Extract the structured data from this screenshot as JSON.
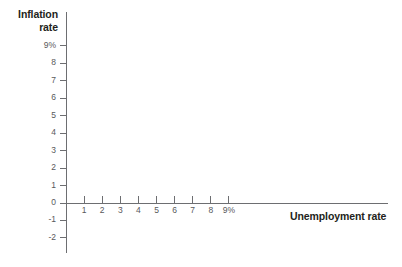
{
  "chart_data": {
    "type": "scatter",
    "title": "",
    "subtitle": "",
    "xlabel": "Unemployment rate",
    "ylabel_lines": [
      "Inflation",
      "rate"
    ],
    "ylabel": "Inflation rate",
    "x_ticks": [
      "1",
      "2",
      "3",
      "4",
      "5",
      "6",
      "7",
      "8",
      "9%"
    ],
    "x_values": [
      1,
      2,
      3,
      4,
      5,
      6,
      7,
      8,
      9
    ],
    "y_ticks": [
      "9%",
      "8",
      "7",
      "6",
      "5",
      "4",
      "3",
      "2",
      "1",
      "0",
      "-1",
      "-2"
    ],
    "y_values": [
      9,
      8,
      7,
      6,
      5,
      4,
      3,
      2,
      1,
      0,
      -1,
      -2
    ],
    "xlim": [
      0,
      9
    ],
    "ylim": [
      -2,
      9
    ],
    "grid": false,
    "legend": null,
    "series": [],
    "annotations": [],
    "note": "Empty axes template: no plotted data points or curves are drawn."
  },
  "style": {
    "axis_color": "#6d6e71",
    "tick_label_color": "#58595b",
    "title_color": "#231f20",
    "background": "#ffffff"
  }
}
